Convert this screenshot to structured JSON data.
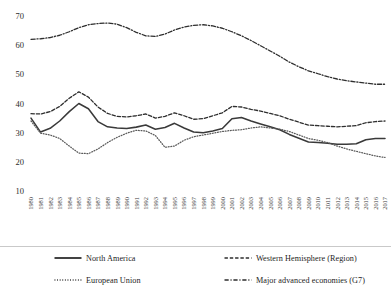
{
  "chart_data": {
    "type": "line",
    "title": "",
    "subtitle": "",
    "xlabel": "",
    "ylabel": "",
    "grid": false,
    "legend_position": "bottom",
    "xlim": [
      1980,
      2017
    ],
    "ylim": [
      10,
      70
    ],
    "yticks": [
      10,
      20,
      30,
      40,
      50,
      60,
      70
    ],
    "ytick_labels": [
      "10",
      "20",
      "30",
      "40",
      "50",
      "60",
      "70"
    ],
    "x": [
      1980,
      1981,
      1982,
      1983,
      1984,
      1985,
      1986,
      1987,
      1988,
      1989,
      1990,
      1991,
      1992,
      1993,
      1994,
      1995,
      1996,
      1997,
      1998,
      1999,
      2000,
      2001,
      2002,
      2003,
      2004,
      2005,
      2006,
      2007,
      2008,
      2009,
      2010,
      2011,
      2012,
      2013,
      2014,
      2015,
      2016,
      2017
    ],
    "xtick_labels": [
      "1980",
      "1981",
      "1982",
      "1983",
      "1984",
      "1985",
      "1986",
      "1987",
      "1988",
      "1989",
      "1990",
      "1991",
      "1992",
      "1993",
      "1994",
      "1995",
      "1996",
      "1997",
      "1998",
      "1999",
      "2000",
      "2001",
      "2002",
      "2003",
      "2004",
      "2005",
      "2006",
      "2007",
      "2008",
      "2009",
      "2010",
      "2011",
      "2012",
      "2013",
      "2014",
      "2015",
      "2016",
      "2017"
    ],
    "series": [
      {
        "name": "North America",
        "style": "solid",
        "color": "#3a3a3a",
        "values": [
          35.0,
          30.2,
          31.5,
          34.0,
          37.2,
          40.0,
          38.2,
          33.8,
          32.0,
          31.6,
          31.4,
          31.9,
          32.6,
          31.2,
          31.8,
          33.2,
          31.6,
          30.2,
          30.0,
          30.6,
          31.4,
          34.8,
          35.2,
          34.0,
          33.0,
          32.0,
          31.0,
          29.4,
          28.1,
          26.8,
          26.6,
          26.4,
          26.0,
          26.0,
          26.2,
          27.6,
          28.0,
          28.0
        ]
      },
      {
        "name": "European Union",
        "style": "dotted",
        "color": "#5a5a5a",
        "values": [
          34.0,
          29.8,
          29.2,
          28.0,
          25.4,
          23.0,
          22.8,
          24.4,
          26.6,
          28.4,
          29.8,
          30.8,
          30.6,
          29.0,
          25.0,
          25.4,
          27.4,
          28.6,
          29.2,
          29.8,
          30.4,
          30.8,
          31.0,
          31.6,
          32.0,
          31.6,
          31.2,
          30.4,
          29.2,
          28.0,
          27.4,
          26.6,
          25.4,
          24.4,
          23.6,
          22.8,
          22.0,
          21.5
        ]
      },
      {
        "name": "Western Hemisphere (Region)",
        "style": "dashed",
        "color": "#2e2e2e",
        "values": [
          36.5,
          36.4,
          37.2,
          39.0,
          41.8,
          44.0,
          42.2,
          38.8,
          36.6,
          35.6,
          35.4,
          35.8,
          36.4,
          35.0,
          35.6,
          36.8,
          35.8,
          34.6,
          34.8,
          35.8,
          36.8,
          39.0,
          38.8,
          38.0,
          37.4,
          36.6,
          35.8,
          34.6,
          33.6,
          32.6,
          32.4,
          32.2,
          32.0,
          32.2,
          32.4,
          33.4,
          33.8,
          34.0
        ]
      },
      {
        "name": "Major advanced economies (G7)",
        "style": "dashdot",
        "color": "#2e2e2e",
        "values": [
          62.0,
          62.2,
          62.6,
          63.4,
          64.6,
          66.0,
          67.0,
          67.4,
          67.6,
          67.2,
          66.0,
          64.4,
          63.2,
          63.0,
          63.8,
          65.2,
          66.2,
          66.8,
          67.0,
          66.6,
          65.8,
          64.6,
          63.2,
          61.6,
          59.8,
          58.0,
          56.2,
          54.2,
          52.6,
          51.2,
          50.2,
          49.2,
          48.4,
          47.8,
          47.4,
          47.0,
          46.6,
          46.6
        ]
      }
    ]
  },
  "legend": {
    "items": [
      {
        "label": "North America",
        "style": "solid"
      },
      {
        "label": "Western Hemisphere (Region)",
        "style": "dashed"
      },
      {
        "label": "European Union",
        "style": "dotted"
      },
      {
        "label": "Major advanced economies (G7)",
        "style": "dashdot"
      }
    ]
  }
}
